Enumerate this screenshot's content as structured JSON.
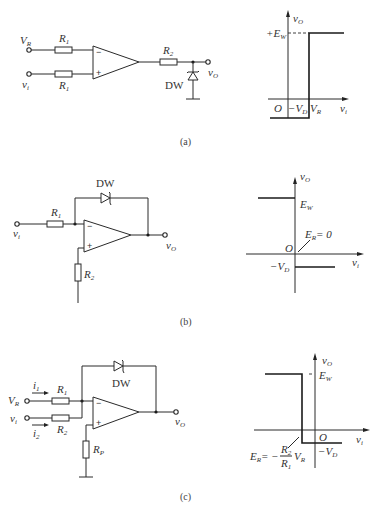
{
  "figure": {
    "panels": [
      {
        "id": "a",
        "caption": "(a)",
        "circuit": {
          "inputs": [
            {
              "label": "V",
              "sub": "R"
            },
            {
              "label": "v",
              "sub": "i"
            }
          ],
          "resistors": [
            {
              "label": "R",
              "sub": "1"
            },
            {
              "label": "R",
              "sub": "1"
            },
            {
              "label": "R",
              "sub": "2"
            }
          ],
          "opamp_pins": {
            "inverting": "−",
            "noninverting": "+"
          },
          "diode": "DW",
          "output": {
            "label": "v",
            "sub": "O"
          }
        },
        "graph": {
          "y_axis": {
            "label": "v",
            "sub": "O"
          },
          "x_axis": {
            "label": "v",
            "sub": "i"
          },
          "origin": "O",
          "high_level": {
            "label": "+E",
            "sub": "W"
          },
          "low_level": {
            "label": "−V",
            "sub": "D"
          },
          "threshold": {
            "label": "V",
            "sub": "R"
          }
        }
      },
      {
        "id": "b",
        "caption": "(b)",
        "circuit": {
          "inputs": [
            {
              "label": "v",
              "sub": "i"
            }
          ],
          "resistors": [
            {
              "label": "R",
              "sub": "1"
            },
            {
              "label": "R",
              "sub": "2"
            }
          ],
          "opamp_pins": {
            "inverting": "−",
            "noninverting": "+"
          },
          "diode": "DW",
          "output": {
            "label": "v",
            "sub": "O"
          }
        },
        "graph": {
          "y_axis": {
            "label": "v",
            "sub": "O"
          },
          "x_axis": {
            "label": "v",
            "sub": "i"
          },
          "origin": "O",
          "high_level": {
            "label": "E",
            "sub": "W"
          },
          "low_level": {
            "label": "−V",
            "sub": "D"
          },
          "threshold": {
            "label": "E",
            "sub": "R",
            "suffix": "= 0"
          }
        }
      },
      {
        "id": "c",
        "caption": "(c)",
        "circuit": {
          "inputs": [
            {
              "label": "V",
              "sub": "R"
            },
            {
              "label": "v",
              "sub": "i"
            }
          ],
          "currents": [
            {
              "label": "i",
              "sub": "1"
            },
            {
              "label": "i",
              "sub": "2"
            }
          ],
          "resistors": [
            {
              "label": "R",
              "sub": "1"
            },
            {
              "label": "R",
              "sub": "2"
            },
            {
              "label": "R",
              "sub": "P"
            }
          ],
          "opamp_pins": {
            "inverting": "−",
            "noninverting": "+"
          },
          "diode": "DW",
          "output": {
            "label": "v",
            "sub": "O"
          }
        },
        "graph": {
          "y_axis": {
            "label": "v",
            "sub": "O"
          },
          "x_axis": {
            "label": "v",
            "sub": "i"
          },
          "origin": "O",
          "high_level": {
            "label": "E",
            "sub": "W"
          },
          "low_level": {
            "label": "−V",
            "sub": "D"
          },
          "threshold": {
            "lhs": "E",
            "lhs_sub": "R",
            "eq": "= −",
            "num": "R",
            "num_sub": "2",
            "den": "R",
            "den_sub": "1",
            "tail": "V",
            "tail_sub": "R"
          }
        }
      }
    ]
  }
}
